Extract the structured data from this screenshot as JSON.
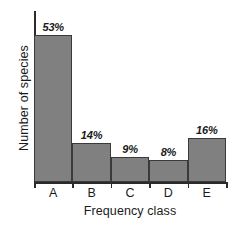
{
  "chart_data": {
    "type": "bar",
    "title": "",
    "subtitle": "",
    "xlabel": "Frequency class",
    "ylabel": "Number of species",
    "categories": [
      "A",
      "B",
      "C",
      "D",
      "E"
    ],
    "values": [
      53,
      14,
      9,
      8,
      16
    ],
    "value_labels": [
      "53%",
      "14%",
      "9%",
      "8%",
      "16%"
    ],
    "units": "percent",
    "ylim": [
      0,
      60
    ],
    "grid": false,
    "legend": null,
    "annotations": [],
    "bar_color": "#808080",
    "bar_border_color": "#3a3a3a",
    "axis_color": "#2b2b2b",
    "bars_adjacent": true
  }
}
